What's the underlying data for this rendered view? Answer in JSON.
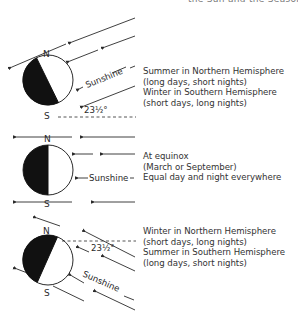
{
  "header": {
    "cut_off_text": "the Sun and the Seasons"
  },
  "diagram": {
    "axis_labels": {
      "north": "N",
      "south": "S"
    },
    "sunlight_label": "Sunshine",
    "tilt_angle_label": "23½°",
    "panels": [
      {
        "id": "northern-summer",
        "lines": [
          "Summer in Northern Hemisphere",
          "(long days, short nights)",
          "Winter in Southern Hemisphere",
          "(short days, long nights)"
        ]
      },
      {
        "id": "equinox",
        "lines": [
          "At equinox",
          "(March or September)",
          "Equal day and night everywhere"
        ]
      },
      {
        "id": "northern-winter",
        "lines": [
          "Winter in Northern Hemisphere",
          "(short days, long nights)",
          "Summer in Southern Hemisphere",
          "(long days, short nights)"
        ]
      }
    ]
  },
  "colors": {
    "ink": "#2a2a2a",
    "night_side": "#111111",
    "day_side": "#ffffff"
  }
}
